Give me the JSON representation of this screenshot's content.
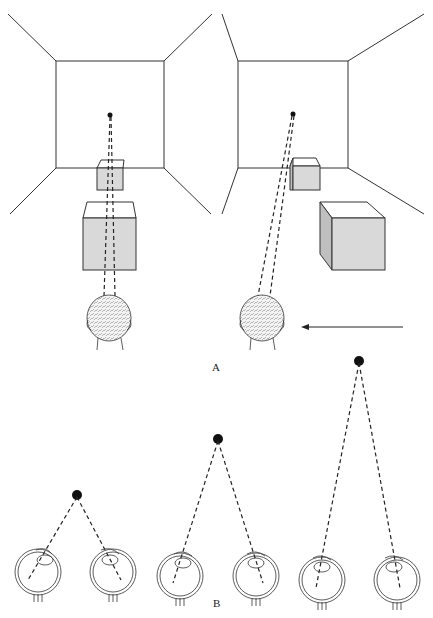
{
  "figure": {
    "panel_a": {
      "label": "A",
      "left_scene": {
        "description": "viewer head facing room; small near cube and larger nearer cube aligned with fixation point",
        "fixation_point": "fixation-dot"
      },
      "right_scene": {
        "description": "viewer head moved left; cubes appear displaced relative to fixation point",
        "motion_arrow": "leftward"
      }
    },
    "panel_b": {
      "label": "B",
      "pairs": [
        {
          "name": "near",
          "target": "near-dot"
        },
        {
          "name": "middle",
          "target": "middle-dot"
        },
        {
          "name": "far",
          "target": "far-dot"
        }
      ]
    },
    "colors": {
      "line": "#222222",
      "cube_fill": "#d9d9d9",
      "cube_side": "#bfbfbf",
      "head": "#f2f2f2"
    }
  }
}
